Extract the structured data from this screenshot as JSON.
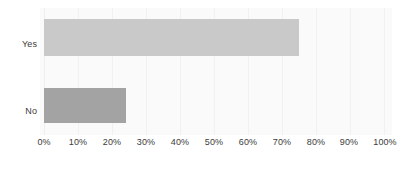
{
  "chart_data": {
    "type": "bar",
    "orientation": "horizontal",
    "title": "",
    "subtitle": "",
    "xlabel": "",
    "ylabel": "",
    "categories": [
      "Yes",
      "No"
    ],
    "values": [
      75,
      24
    ],
    "xlim": [
      0,
      100
    ],
    "x_ticks": [
      0,
      10,
      20,
      30,
      40,
      50,
      60,
      70,
      80,
      90,
      100
    ],
    "x_tick_labels": [
      "0%",
      "10%",
      "20%",
      "30%",
      "40%",
      "50%",
      "60%",
      "70%",
      "80%",
      "90%",
      "100%"
    ],
    "grid": true,
    "grid_axis": "x",
    "legend": false,
    "legend_position": "none",
    "bar_colors": [
      "#c9c9c9",
      "#a3a3a3"
    ],
    "plot_background": "#fafafa",
    "grid_color": "#f1f1f1",
    "text_color": "#3b3b3b",
    "bars": [
      {
        "label": "Yes",
        "value": 75,
        "value_label": "75%",
        "color": "#c9c9c9"
      },
      {
        "label": "No",
        "value": 24,
        "value_label": "24%",
        "color": "#a3a3a3"
      }
    ]
  }
}
